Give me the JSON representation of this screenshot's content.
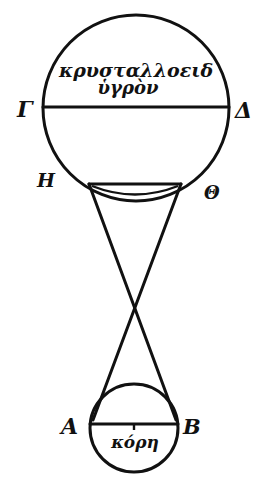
{
  "diagram": {
    "large_circle": {
      "text_line1": "κρυσταλλοειδ",
      "text_line2": "ὑγρὸν",
      "diameter_left_label": "Γ",
      "diameter_right_label": "Δ",
      "chord_left_label": "Η",
      "chord_right_label": "Θ"
    },
    "small_circle": {
      "text": "κόρη",
      "diameter_left_label": "Α",
      "diameter_right_label": "Β"
    },
    "colors": {
      "ink": "#111111",
      "background": "#ffffff"
    }
  }
}
